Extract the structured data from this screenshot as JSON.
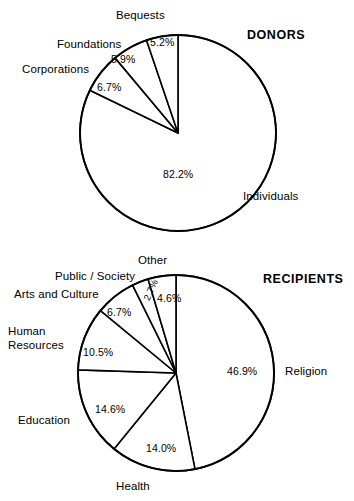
{
  "figure": {
    "background_color": "#ffffff",
    "line_color": "#000000"
  },
  "charts": [
    {
      "id": "donors",
      "title": "DONORS",
      "title_pos": {
        "x": 247,
        "y": 28
      },
      "center": {
        "x": 178,
        "y": 133
      },
      "radius": 98,
      "start_angle_deg": 0,
      "direction": "clockwise",
      "slices": [
        {
          "name": "Individuals",
          "value": 82.2,
          "pct_label": "82.2%",
          "pct_pos": {
            "x": 163,
            "y": 169
          },
          "name_pos": {
            "x": 243,
            "y": 190
          },
          "name_align": "left"
        },
        {
          "name": "Corporations",
          "value": 6.7,
          "pct_label": "6.7%",
          "pct_pos": {
            "x": 97,
            "y": 82
          },
          "name_pos": {
            "x": 22,
            "y": 63
          },
          "name_align": "left"
        },
        {
          "name": "Foundations",
          "value": 5.9,
          "pct_label": "5.9%",
          "pct_pos": {
            "x": 111,
            "y": 54
          },
          "name_pos": {
            "x": 57,
            "y": 38
          },
          "name_align": "left"
        },
        {
          "name": "Bequests",
          "value": 5.2,
          "pct_label": "5.2%",
          "pct_pos": {
            "x": 150,
            "y": 37
          },
          "name_pos": {
            "x": 116,
            "y": 9
          },
          "name_align": "left"
        }
      ]
    },
    {
      "id": "recipients",
      "title": "RECIPIENTS",
      "title_pos": {
        "x": 263,
        "y": 272
      },
      "center": {
        "x": 176,
        "y": 373
      },
      "radius": 98,
      "start_angle_deg": 0,
      "direction": "clockwise",
      "slices": [
        {
          "name": "Religion",
          "value": 46.9,
          "pct_label": "46.9%",
          "pct_pos": {
            "x": 227,
            "y": 366
          },
          "name_pos": {
            "x": 285,
            "y": 365
          },
          "name_align": "left"
        },
        {
          "name": "Health",
          "value": 14.0,
          "pct_label": "14.0%",
          "pct_pos": {
            "x": 146,
            "y": 443
          },
          "name_pos": {
            "x": 116,
            "y": 480
          },
          "name_align": "left"
        },
        {
          "name": "Education",
          "value": 14.6,
          "pct_label": "14.6%",
          "pct_pos": {
            "x": 95,
            "y": 404
          },
          "name_pos": {
            "x": 18,
            "y": 414
          },
          "name_align": "left"
        },
        {
          "name": "Human Resources",
          "value": 10.5,
          "pct_label": "10.5%",
          "pct_pos": {
            "x": 83,
            "y": 347
          },
          "name_pos": {
            "x": 8,
            "y": 325
          },
          "name_align": "left",
          "name_lines": [
            "Human",
            "Resources"
          ]
        },
        {
          "name": "Arts and Culture",
          "value": 6.7,
          "pct_label": "6.7%",
          "pct_pos": {
            "x": 107,
            "y": 307
          },
          "name_pos": {
            "x": 14,
            "y": 288
          },
          "name_align": "left"
        },
        {
          "name": "Public / Society",
          "value": 2.7,
          "pct_label": "2.7%",
          "pct_pos": {
            "x": 142,
            "y": 298
          },
          "name_pos": {
            "x": 55,
            "y": 270
          },
          "name_align": "left",
          "pct_rotated": true
        },
        {
          "name": "Other",
          "value": 4.6,
          "pct_label": "4.6%",
          "pct_pos": {
            "x": 157,
            "y": 293
          },
          "name_pos": {
            "x": 138,
            "y": 254
          },
          "name_align": "left"
        }
      ]
    }
  ],
  "chart_data": [
    {
      "type": "pie",
      "title": "DONORS",
      "categories": [
        "Individuals",
        "Corporations",
        "Foundations",
        "Bequests"
      ],
      "values": [
        82.2,
        6.7,
        5.9,
        5.2
      ],
      "value_labels": [
        "82.2%",
        "6.7%",
        "5.9%",
        "5.2%"
      ],
      "units": "percent",
      "legend": "inline-callout-labels",
      "total": 100.0,
      "xlabel": "",
      "ylabel": ""
    },
    {
      "type": "pie",
      "title": "RECIPIENTS",
      "categories": [
        "Religion",
        "Health",
        "Education",
        "Human Resources",
        "Arts and Culture",
        "Public / Society",
        "Other"
      ],
      "values": [
        46.9,
        14.0,
        14.6,
        10.5,
        6.7,
        2.7,
        4.6
      ],
      "value_labels": [
        "46.9%",
        "14.0%",
        "14.6%",
        "10.5%",
        "6.7%",
        "2.7%",
        "4.6%"
      ],
      "units": "percent",
      "legend": "inline-callout-labels",
      "total": 100.0,
      "xlabel": "",
      "ylabel": ""
    }
  ]
}
